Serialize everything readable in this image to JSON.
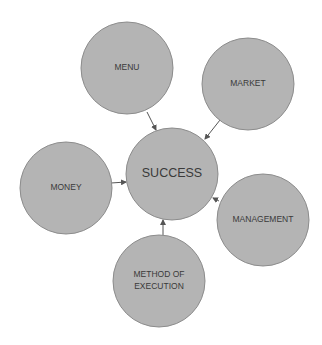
{
  "diagram": {
    "type": "hub-and-spoke",
    "colors": {
      "node_fill": "#b4b4b4",
      "node_stroke": "#8c8c8c",
      "text": "#3a3a3a",
      "arrow": "#555555"
    },
    "center": {
      "id": "success",
      "label": "SUCCESS",
      "cx": 172,
      "cy": 174,
      "r": 46,
      "font_size": 12.5
    },
    "nodes": [
      {
        "id": "menu",
        "lines": [
          "MENU"
        ],
        "cx": 127,
        "cy": 68,
        "r": 46,
        "font_size": 8.5
      },
      {
        "id": "market",
        "lines": [
          "MARKET"
        ],
        "cx": 248,
        "cy": 84,
        "r": 46,
        "font_size": 8.5
      },
      {
        "id": "money",
        "lines": [
          "MONEY"
        ],
        "cx": 66,
        "cy": 188,
        "r": 46,
        "font_size": 8.5
      },
      {
        "id": "management",
        "lines": [
          "MANAGEMENT"
        ],
        "cx": 263,
        "cy": 220,
        "r": 46,
        "font_size": 8.5
      },
      {
        "id": "method-of-execution",
        "lines": [
          "METHOD OF",
          "EXECUTION"
        ],
        "cx": 159,
        "cy": 281,
        "r": 46,
        "font_size": 8.5
      }
    ],
    "edges": [
      {
        "from": "menu",
        "to": "success",
        "x1": 147,
        "y1": 112,
        "x2": 156,
        "y2": 130
      },
      {
        "from": "market",
        "to": "success",
        "x1": 220,
        "y1": 120,
        "x2": 205,
        "y2": 139
      },
      {
        "from": "money",
        "to": "success",
        "x1": 111,
        "y1": 183,
        "x2": 126,
        "y2": 182
      },
      {
        "from": "management",
        "to": "success",
        "x1": 219,
        "y1": 201,
        "x2": 213,
        "y2": 198
      },
      {
        "from": "method-of-execution",
        "to": "success",
        "x1": 163,
        "y1": 235,
        "x2": 163,
        "y2": 220
      }
    ]
  }
}
